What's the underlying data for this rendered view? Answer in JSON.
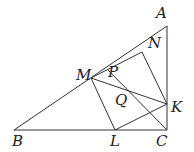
{
  "diagram": {
    "points": {
      "A": {
        "label": "A",
        "x": 167,
        "y": 26
      },
      "B": {
        "label": "B",
        "x": 14,
        "y": 130
      },
      "C": {
        "label": "C",
        "x": 167,
        "y": 130
      },
      "M": {
        "label": "M",
        "x": 91,
        "y": 78
      },
      "N": {
        "label": "N",
        "x": 153,
        "y": 33
      },
      "P": {
        "label": "P",
        "x": 108,
        "y": 70
      },
      "Q": {
        "label": "Q",
        "x": 130,
        "y": 91
      },
      "K": {
        "label": "K",
        "x": 167,
        "y": 104
      },
      "L": {
        "label": "L",
        "x": 115,
        "y": 130
      }
    },
    "stroke_color": "#333333"
  }
}
